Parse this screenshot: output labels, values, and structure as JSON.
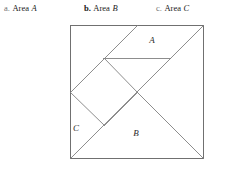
{
  "captions": [
    {
      "marker": "a.",
      "marker_bold": false,
      "word": "Area",
      "variable": "A"
    },
    {
      "marker": "b.",
      "marker_bold": true,
      "word": "Area",
      "variable": "B"
    },
    {
      "marker": "c.",
      "marker_bold": false,
      "word": "Area",
      "variable": "C"
    }
  ],
  "figure": {
    "name": "tangram-square",
    "stroke_color": "#808080",
    "border_color": "#707070",
    "background": "#ffffff",
    "square": {
      "x": 70,
      "y": 25,
      "size": 133
    },
    "region_labels": [
      {
        "text": "A",
        "x": 152,
        "y": 43
      },
      {
        "text": "B",
        "x": 136,
        "y": 136
      },
      {
        "text": "C",
        "x": 76,
        "y": 131
      }
    ],
    "segments": [
      {
        "name": "main-diagonal",
        "x1": 70,
        "y1": 158,
        "x2": 203,
        "y2": 25
      },
      {
        "name": "diamond-upper-left",
        "x1": 70,
        "y1": 92,
        "x2": 104,
        "y2": 58
      },
      {
        "name": "diamond-upper-right",
        "x1": 104,
        "y1": 58,
        "x2": 137,
        "y2": 92
      },
      {
        "name": "diamond-lower-right",
        "x1": 137,
        "y1": 92,
        "x2": 104,
        "y2": 125
      },
      {
        "name": "diamond-lower-left",
        "x1": 104,
        "y1": 125,
        "x2": 70,
        "y2": 92
      },
      {
        "name": "horizontal-chord",
        "x1": 103,
        "y1": 58,
        "x2": 170,
        "y2": 58
      },
      {
        "name": "upper-diagonal",
        "x1": 104,
        "y1": 58,
        "x2": 137,
        "y2": 25
      },
      {
        "name": "right-diagonal",
        "x1": 137,
        "y1": 92,
        "x2": 203,
        "y2": 158
      }
    ]
  }
}
